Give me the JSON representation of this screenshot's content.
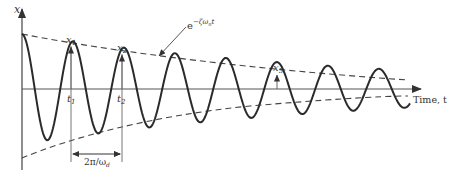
{
  "diagram": {
    "type": "damped-oscillation",
    "y_axis_label": "x",
    "x_axis_label": "Time, t",
    "envelope_label_base": "e",
    "envelope_label_exp": "−ζω",
    "envelope_label_sub": "n",
    "envelope_label_t": "t",
    "peak_labels": [
      {
        "name": "x",
        "sub": "1"
      },
      {
        "name": "x",
        "sub": "2"
      },
      {
        "name": "x",
        "sub": "5"
      }
    ],
    "time_labels": [
      {
        "name": "t",
        "sub": "1"
      },
      {
        "name": "t",
        "sub": "2"
      }
    ],
    "period_label_main": "2π/ω",
    "period_label_sub": "d",
    "colors": {
      "curve": "#2a2a2a",
      "axis": "#555555",
      "envelope": "#444444"
    }
  }
}
